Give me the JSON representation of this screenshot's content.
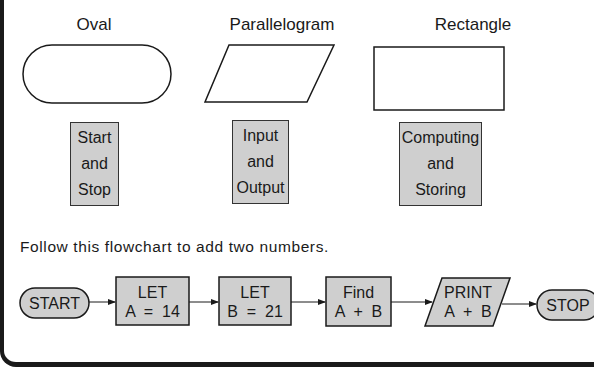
{
  "symbols": [
    {
      "name": "Oval",
      "purpose": [
        "Start",
        "and",
        "Stop"
      ]
    },
    {
      "name": "Parallelogram",
      "purpose": [
        "Input",
        "and",
        "Output"
      ]
    },
    {
      "name": "Rectangle",
      "purpose": [
        "Computing",
        "and",
        "Storing"
      ]
    }
  ],
  "instruction": "Follow this flowchart to add two numbers.",
  "flowchart": {
    "start": "START",
    "steps": [
      {
        "shape": "rectangle",
        "line1": "LET",
        "line2": "A  =  14"
      },
      {
        "shape": "rectangle",
        "line1": "LET",
        "line2": "B  =  21"
      },
      {
        "shape": "rectangle",
        "line1": "Find",
        "line2": "A  +  B"
      },
      {
        "shape": "parallelogram",
        "line1": "PRINT",
        "line2": "A  +  B"
      }
    ],
    "stop": "STOP"
  },
  "colors": {
    "fill_gray": "#cfcfcf",
    "stroke": "#1a1a1a"
  }
}
